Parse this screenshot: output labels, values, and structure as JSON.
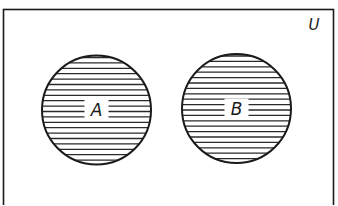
{
  "diagram": {
    "type": "venn",
    "title": "",
    "universe": {
      "label": "U",
      "rect": {
        "x": 3.5,
        "y": 9.5,
        "width": 330,
        "height": 210
      },
      "label_pos": {
        "x": 314,
        "y": 30
      }
    },
    "sets": [
      {
        "label": "A",
        "cx": 96.5,
        "cy": 110,
        "r": 54.5,
        "shaded": true,
        "pattern": "horizontal-hatch"
      },
      {
        "label": "B",
        "cx": 236.5,
        "cy": 108.5,
        "r": 54.5,
        "shaded": true,
        "pattern": "horizontal-hatch"
      }
    ],
    "relationship": "disjoint",
    "colors": {
      "stroke": "#1a1a1a",
      "background": "#ffffff",
      "hatch": "#2a2a2a"
    },
    "hatch_spacing": 5.4
  }
}
